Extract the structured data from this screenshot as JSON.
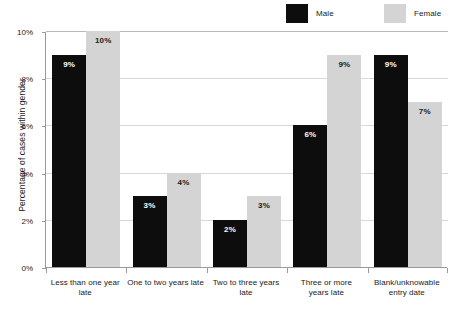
{
  "chart_data": {
    "type": "bar",
    "title": "",
    "subtitle": "",
    "xlabel": "",
    "ylabel": "Percentage of cases within gender",
    "categories": [
      "Less than one year late",
      "One to two years late",
      "Two to three years late",
      "Three or more years late",
      "Blank/unknowable entry date"
    ],
    "category_lines": [
      [
        "Less than one year late"
      ],
      [
        "One to two years late"
      ],
      [
        "Two to three years late"
      ],
      [
        "Three or more",
        "years late"
      ],
      [
        "Blank/unknowable",
        "entry date"
      ]
    ],
    "series": [
      {
        "name": "Male",
        "color": "#0d0d0d",
        "values": [
          9,
          3,
          2,
          6,
          9
        ],
        "labels": [
          "9%",
          "3%",
          "2%",
          "6%",
          "9%"
        ]
      },
      {
        "name": "Female",
        "color": "#d4d4d4",
        "values": [
          10,
          4,
          3,
          9,
          7
        ],
        "labels": [
          "10%",
          "4%",
          "3%",
          "9%",
          "7%"
        ]
      }
    ],
    "ylim": [
      0,
      10
    ],
    "yticks": [
      0,
      2,
      4,
      6,
      8,
      10
    ],
    "ytick_labels": [
      "0%",
      "2%",
      "4%",
      "6%",
      "8%",
      "10%"
    ],
    "grid": true,
    "grid_axis": "y",
    "legend_position": "top-right"
  },
  "legend": {
    "entries": [
      {
        "label": "Male",
        "color": "#0d0d0d"
      },
      {
        "label": "Female",
        "color": "#d4d4d4"
      }
    ]
  },
  "colors": {
    "background": "#ffffff",
    "male": "#0d0d0d",
    "female": "#d4d4d4",
    "gridline": "#d8d8d8",
    "axis": "#9a9a9a",
    "text": "#1a1a1a"
  }
}
